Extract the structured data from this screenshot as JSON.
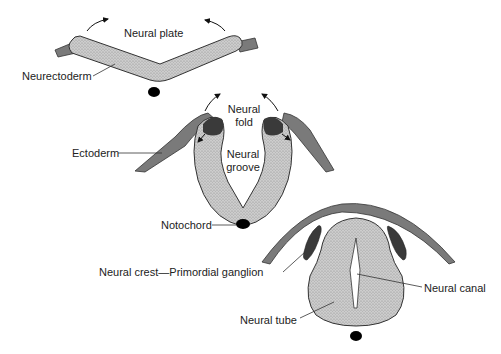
{
  "colors": {
    "neural_tissue": "#c9c9c9",
    "ectoderm": "#7a7a7a",
    "neural_crest": "#3a3a3a",
    "notochord": "#000000",
    "outline": "#333333",
    "background": "#ffffff"
  },
  "stages": [
    {
      "name": "Neural plate stage",
      "labels": {
        "neural_plate": "Neural plate",
        "neurectoderm": "Neurectoderm"
      }
    },
    {
      "name": "Neural groove stage",
      "labels": {
        "neural_fold": "Neural fold",
        "neural_fold_line1": "Neural",
        "neural_fold_line2": "fold",
        "ectoderm": "Ectoderm",
        "neural_groove_line1": "Neural",
        "neural_groove_line2": "groove",
        "notochord": "Notochord"
      }
    },
    {
      "name": "Neural tube stage",
      "labels": {
        "neural_crest": "Neural crest—Primordial ganglion",
        "neural_canal": "Neural canal",
        "neural_tube": "Neural tube"
      }
    }
  ]
}
